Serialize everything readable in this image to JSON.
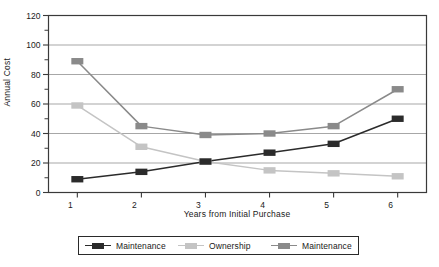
{
  "chart_data": {
    "type": "line",
    "title": "",
    "xlabel": "Years from Initial Purchase",
    "ylabel": "Annual Cost",
    "x": [
      1,
      2,
      3,
      4,
      5,
      6
    ],
    "xtick_labels": [
      "1",
      "2",
      "3",
      "4",
      "5",
      "6"
    ],
    "xlim": [
      0.55,
      6.45
    ],
    "ylim": [
      0,
      120
    ],
    "ytick_labels": [
      "0",
      "20",
      "40",
      "60",
      "80",
      "100",
      "120"
    ],
    "yticks": [
      0,
      20,
      40,
      60,
      80,
      100,
      120
    ],
    "yminor_step": 10,
    "grid": "horizontal-major",
    "legend_position": "below",
    "series": [
      {
        "name": "Maintenance",
        "color": "#2b2b2b",
        "values": [
          9,
          14,
          21,
          27,
          33,
          50
        ]
      },
      {
        "name": "Ownership",
        "color": "#c4c4c4",
        "values": [
          59,
          31,
          21,
          15,
          13,
          11
        ]
      },
      {
        "name": "Maintenance",
        "color": "#8a8a8a",
        "values": [
          89,
          45,
          39,
          40,
          45,
          70
        ]
      }
    ]
  },
  "axis": {
    "ylabel": "Annual Cost",
    "xlabel": "Years from Initial Purchase",
    "yticks": [
      "120",
      "100",
      "80",
      "60",
      "40",
      "20",
      "0"
    ],
    "xticks": [
      "1",
      "2",
      "3",
      "4",
      "5",
      "6"
    ]
  },
  "legend": {
    "entries": [
      {
        "label": "Maintenance",
        "color": "#2b2b2b"
      },
      {
        "label": "Ownership",
        "color": "#c4c4c4"
      },
      {
        "label": "Maintenance",
        "color": "#8a8a8a"
      }
    ]
  },
  "colors": {
    "series_black": "#2b2b2b",
    "series_light_gray": "#c4c4c4",
    "series_mid_gray": "#8a8a8a",
    "axis": "#3a3a3a",
    "grid": "#9d9d9d",
    "background": "#ffffff"
  }
}
